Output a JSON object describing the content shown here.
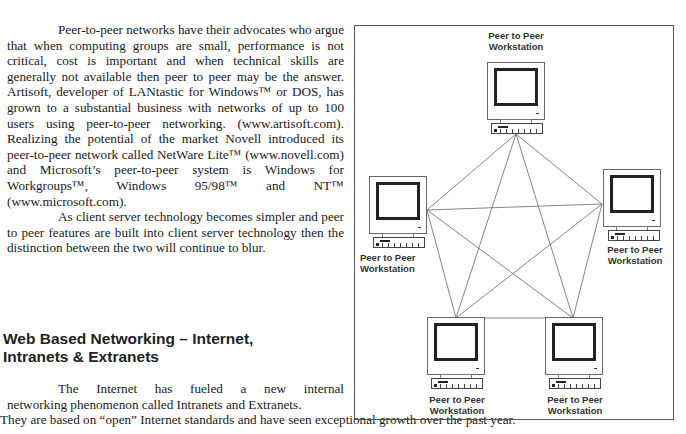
{
  "column_text": {
    "paragraph_1": "Peer-to-peer networks have their advocates who argue that when computing groups are small, performance is not critical, cost is important and when technical skills are generally not available then peer to peer may be the answer. Artisoft, developer of LANtastic for Windows™ or DOS, has grown to a substantial business with networks of up to 100 users using peer-to-peer networking.  (www.artisoft.com). Realizing the potential of the market Novell introduced its peer-to-peer network called NetWare Lite™ (www.novell.com) and Microsoft’s peer-to-peer system is Windows for Workgroups™, Windows 95/98™ and NT™ (www.microsoft.com).",
    "paragraph_2": "As client server technology becomes simpler and peer to peer features are built into client server technology then the distinction between the two will continue to blur."
  },
  "section": {
    "heading_line_1": "Web Based Networking – Internet,",
    "heading_line_2": "Intranets & Extranets",
    "paragraph_line_1": "The Internet has fueled a new internal",
    "paragraph_line_2": "networking phenomenon called Intranets and Extranets.",
    "paragraph_line_3": "They are based on  “open” Internet standards and have seen exceptional growth over the past year."
  },
  "figure": {
    "line_color": "#666666",
    "workstations": [
      {
        "id": "top",
        "label_1": "Peer to Peer",
        "label_2": "Workstation"
      },
      {
        "id": "left",
        "label_1": "Peer to Peer",
        "label_2": "Workstation"
      },
      {
        "id": "right",
        "label_1": "Peer to Peer",
        "label_2": "Workstation"
      },
      {
        "id": "bottom-left",
        "label_1": "Peer to Peer",
        "label_2": "Workstation"
      },
      {
        "id": "bottom-right",
        "label_1": "Peer to Peer",
        "label_2": "Workstation"
      }
    ]
  }
}
